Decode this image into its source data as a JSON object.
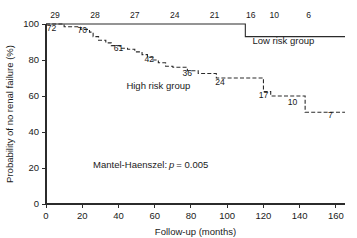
{
  "chart_data": {
    "type": "line",
    "title": "",
    "xlabel": "Follow-up (months)",
    "ylabel": "Probability of no renal failure (%)",
    "xlim": [
      0,
      165
    ],
    "ylim": [
      0,
      100
    ],
    "xticks": [
      0,
      20,
      40,
      60,
      80,
      100,
      120,
      140,
      160
    ],
    "xtick_labels": [
      "0",
      "20",
      "40",
      "60",
      "80",
      "100",
      "120",
      "140",
      "160"
    ],
    "yticks": [
      0,
      20,
      40,
      60,
      80,
      100
    ],
    "ytick_labels": [
      "0",
      "20",
      "40",
      "60",
      "80",
      "100"
    ],
    "grid": false,
    "legend_position": "inline-annotations",
    "annotations": [
      {
        "text": "Mantel-Haenszel:",
        "x": 26,
        "y": 20
      },
      {
        "text": "p",
        "x": 76,
        "y": 20,
        "style": "italic"
      },
      {
        "text": "= 0.005",
        "x": 82,
        "y": 20
      }
    ],
    "series": [
      {
        "name": "Low risk group",
        "label": "Low risk group",
        "line_style": "solid",
        "label_x": 131,
        "label_y": 89,
        "at_risk_position": "above-curve",
        "at_risk_labels": [
          {
            "n": "29",
            "x": 5
          },
          {
            "n": "28",
            "x": 27
          },
          {
            "n": "27",
            "x": 49
          },
          {
            "n": "24",
            "x": 71
          },
          {
            "n": "21",
            "x": 93
          },
          {
            "n": "16",
            "x": 113
          },
          {
            "n": "10",
            "x": 126
          },
          {
            "n": "6",
            "x": 145
          }
        ],
        "steps": [
          {
            "x": 0,
            "y": 100
          },
          {
            "x": 110,
            "y": 100
          },
          {
            "x": 110,
            "y": 93
          },
          {
            "x": 165,
            "y": 93
          }
        ]
      },
      {
        "name": "High risk group",
        "label": "High risk group",
        "line_style": "dashed",
        "label_x": 62,
        "label_y": 64,
        "at_risk_position": "below-curve",
        "at_risk_labels": [
          {
            "n": "72",
            "x": 3,
            "y": 96
          },
          {
            "n": "70",
            "x": 20,
            "y": 95
          },
          {
            "n": "61",
            "x": 40,
            "y": 85
          },
          {
            "n": "42",
            "x": 57,
            "y": 79
          },
          {
            "n": "36",
            "x": 78,
            "y": 71
          },
          {
            "n": "24",
            "x": 96,
            "y": 66
          },
          {
            "n": "17",
            "x": 120,
            "y": 59
          },
          {
            "n": "10",
            "x": 136,
            "y": 55
          },
          {
            "n": "7",
            "x": 157,
            "y": 48
          }
        ],
        "steps": [
          {
            "x": 0,
            "y": 100
          },
          {
            "x": 10,
            "y": 100
          },
          {
            "x": 10,
            "y": 98.5
          },
          {
            "x": 19,
            "y": 98.5
          },
          {
            "x": 19,
            "y": 97
          },
          {
            "x": 24,
            "y": 97
          },
          {
            "x": 24,
            "y": 95.5
          },
          {
            "x": 26,
            "y": 95.5
          },
          {
            "x": 26,
            "y": 93
          },
          {
            "x": 29,
            "y": 93
          },
          {
            "x": 29,
            "y": 91
          },
          {
            "x": 33,
            "y": 91
          },
          {
            "x": 33,
            "y": 89.5
          },
          {
            "x": 36,
            "y": 89.5
          },
          {
            "x": 36,
            "y": 88
          },
          {
            "x": 41,
            "y": 88
          },
          {
            "x": 41,
            "y": 86.5
          },
          {
            "x": 45,
            "y": 86.5
          },
          {
            "x": 45,
            "y": 86
          },
          {
            "x": 49,
            "y": 86
          },
          {
            "x": 49,
            "y": 84.5
          },
          {
            "x": 53,
            "y": 84.5
          },
          {
            "x": 53,
            "y": 83
          },
          {
            "x": 56,
            "y": 83
          },
          {
            "x": 56,
            "y": 81.5
          },
          {
            "x": 59,
            "y": 81.5
          },
          {
            "x": 59,
            "y": 80
          },
          {
            "x": 62,
            "y": 80
          },
          {
            "x": 62,
            "y": 78.5
          },
          {
            "x": 66,
            "y": 78.5
          },
          {
            "x": 66,
            "y": 76.5
          },
          {
            "x": 70,
            "y": 76.5
          },
          {
            "x": 70,
            "y": 76
          },
          {
            "x": 78,
            "y": 76
          },
          {
            "x": 78,
            "y": 74
          },
          {
            "x": 84,
            "y": 74
          },
          {
            "x": 84,
            "y": 72.5
          },
          {
            "x": 94,
            "y": 72.5
          },
          {
            "x": 94,
            "y": 70
          },
          {
            "x": 120,
            "y": 70
          },
          {
            "x": 120,
            "y": 62.5
          },
          {
            "x": 124,
            "y": 62.5
          },
          {
            "x": 124,
            "y": 60
          },
          {
            "x": 143,
            "y": 60
          },
          {
            "x": 143,
            "y": 51
          },
          {
            "x": 165,
            "y": 51
          }
        ]
      }
    ]
  }
}
